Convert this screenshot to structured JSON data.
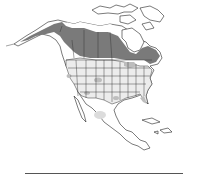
{
  "map": {
    "region": "North America",
    "type": "species range map",
    "legend": {
      "breeding": {
        "color": "#7a7a7a"
      },
      "year_round": {
        "color": "#bdbdbd"
      },
      "winter": {
        "color": "#dcdcdc"
      }
    }
  }
}
